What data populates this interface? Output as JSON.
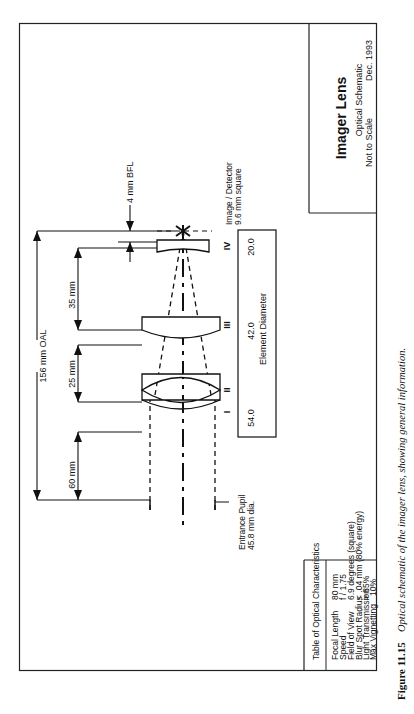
{
  "figure": {
    "orientation": "rotated 90deg counter-clockwise (landscape page shown in portrait)",
    "caption_number": "Figure 11.15",
    "caption_text": "Optical schematic of the imager lens, showing general information."
  },
  "title_block": {
    "title": "Imager Lens",
    "subtitle": "Optical Schematic",
    "scale_note": "Not to Scale",
    "date": "Dec. 1993"
  },
  "characteristics_table": {
    "heading": "Table of Optical Characteristics",
    "rows": [
      {
        "label": "Focal Length",
        "value": "80 mm"
      },
      {
        "label": "Speed",
        "value": "f / 1.75"
      },
      {
        "label": "Field of View",
        "value": "6.9 degrees (square)"
      },
      {
        "label": "Blur Spot Radius",
        "value": "< .04 mm (80% energy)"
      },
      {
        "label": "Light Transmission",
        "value": "> 85%"
      },
      {
        "label": "Max Vignetting",
        "value": "10%"
      }
    ]
  },
  "dimensions": {
    "overall_length": "156 mm OAL",
    "pupil_to_element1": "60 mm",
    "element2_to_element3": "25 mm",
    "element3_to_element4": "35 mm",
    "back_focal_length": "4 mm BFL"
  },
  "elements": [
    {
      "id": "I",
      "label": "I"
    },
    {
      "id": "II",
      "label": "II"
    },
    {
      "id": "III",
      "label": "III"
    },
    {
      "id": "IV",
      "label": "IV"
    }
  ],
  "element_diameter": {
    "label": "Element Diameter",
    "values": [
      "54.0",
      "42.0",
      "20.0"
    ]
  },
  "annotations": {
    "entrance_pupil_line1": "Entrance Pupil",
    "entrance_pupil_line2": "45.8 mm dia.",
    "image_line1": "Image / Detector",
    "image_line2": "9.6 mm square"
  }
}
